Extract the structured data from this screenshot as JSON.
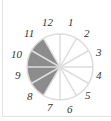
{
  "diagram": {
    "type": "clock-fraction-circle",
    "segments": 12,
    "labels": [
      "12",
      "1",
      "2",
      "3",
      "4",
      "5",
      "6",
      "7",
      "8",
      "9",
      "10",
      "11"
    ],
    "shaded_from_hour": 8,
    "shaded_to_hour": 11,
    "shaded_segments": 3,
    "colors": {
      "shade": "#8c8c8c",
      "lines": "#dddddd",
      "text": "#333333",
      "background": "#ffffff"
    }
  }
}
